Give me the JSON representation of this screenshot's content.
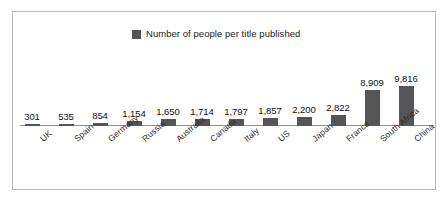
{
  "chart_data": {
    "type": "bar",
    "title": "",
    "subtitle": "",
    "xlabel": "",
    "ylabel": "",
    "grid": false,
    "legend_position": "top-center",
    "legend": [
      "Number of people per title published"
    ],
    "axis_visible": true,
    "ylim": [
      0,
      9816
    ],
    "categories": [
      "UK",
      "Spain",
      "Germany",
      "Russia",
      "Australia",
      "Canada",
      "Italy",
      "US",
      "Japan",
      "France",
      "South Africa",
      "China"
    ],
    "values": [
      301,
      535,
      854,
      1154,
      1650,
      1714,
      1797,
      1857,
      2200,
      2822,
      8909,
      9816
    ],
    "value_labels": [
      "301",
      "535",
      "854",
      "1,154",
      "1,650",
      "1,714",
      "1,797",
      "1,857",
      "2,200",
      "2,822",
      "8,909",
      "9,816"
    ],
    "series": [
      {
        "name": "Number of people per title published",
        "color": "#555557",
        "values": [
          301,
          535,
          854,
          1154,
          1650,
          1714,
          1797,
          1857,
          2200,
          2822,
          8909,
          9816
        ]
      }
    ]
  },
  "legend": {
    "label": "Number of people per title published",
    "swatch_color": "#555557"
  },
  "frame": {
    "border_color": "#b9b9b9",
    "background": "#ffffff"
  },
  "axis": {
    "line_color": "#8f8f8f"
  }
}
